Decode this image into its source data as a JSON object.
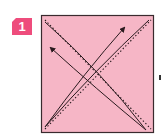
{
  "step": {
    "number": "1",
    "badge_color": "#ee4c7c"
  },
  "paper": {
    "fill_color": "#f6b6c6",
    "border_color": "#3a2a2e",
    "x": 41,
    "y": 15,
    "width": 113,
    "height": 118
  },
  "fold_lines": [
    {
      "type": "valley-dotted",
      "from": "top-left",
      "to": "bottom-right"
    },
    {
      "type": "valley-dotted",
      "from": "bottom-left",
      "to": "top-right"
    }
  ],
  "arrows": [
    {
      "name": "fold-arrow-to-top-left",
      "from": "bottom-right",
      "to": "top-left",
      "icon": "curved-arrow"
    },
    {
      "name": "fold-arrow-to-top-right",
      "from": "bottom-left",
      "to": "top-right",
      "icon": "curved-arrow"
    }
  ],
  "colors": {
    "line": "#2a1a1e",
    "arrow": "#2a1a1e"
  }
}
